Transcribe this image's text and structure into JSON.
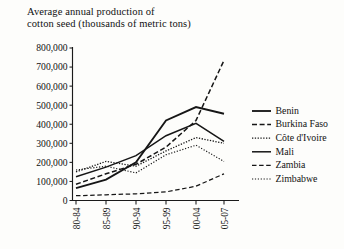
{
  "chart_data": {
    "type": "line",
    "title": "Average annual production of\ncotton seed (thousands of metric tons)",
    "xlabel": "",
    "ylabel": "",
    "ylim": [
      0,
      800000
    ],
    "ytick_values": [
      0,
      100000,
      200000,
      300000,
      400000,
      500000,
      600000,
      700000,
      800000
    ],
    "ytick_labels": [
      "0",
      "100,000",
      "200,000",
      "300,000",
      "400,000",
      "500,000",
      "600,000",
      "700,000",
      "800,000"
    ],
    "grid": false,
    "legend_position": "right",
    "categories": [
      "80-84",
      "85-89",
      "90-94",
      "95-99",
      "00-04",
      "05-07"
    ],
    "series": [
      {
        "name": "Benin",
        "style": "solid-thick",
        "values": [
          65000,
          110000,
          200000,
          420000,
          490000,
          455000
        ]
      },
      {
        "name": "Burkina Faso",
        "style": "dashed",
        "values": [
          85000,
          140000,
          190000,
          280000,
          420000,
          735000
        ]
      },
      {
        "name": "Côte d'Ivoire",
        "style": "dotted",
        "values": [
          150000,
          205000,
          180000,
          260000,
          330000,
          300000
        ]
      },
      {
        "name": "Mali",
        "style": "solid",
        "values": [
          125000,
          175000,
          235000,
          340000,
          405000,
          310000
        ]
      },
      {
        "name": "Zambia",
        "style": "dashed-thin",
        "values": [
          25000,
          30000,
          35000,
          45000,
          75000,
          140000
        ]
      },
      {
        "name": "Zimbabwe",
        "style": "dotted-thin",
        "values": [
          160000,
          180000,
          145000,
          240000,
          290000,
          205000
        ]
      }
    ]
  },
  "legend": {
    "items": [
      {
        "label": "Benin"
      },
      {
        "label": "Burkina Faso"
      },
      {
        "label": "Côte d'Ivoire"
      },
      {
        "label": "Mali"
      },
      {
        "label": "Zambia"
      },
      {
        "label": "Zimbabwe"
      }
    ]
  }
}
